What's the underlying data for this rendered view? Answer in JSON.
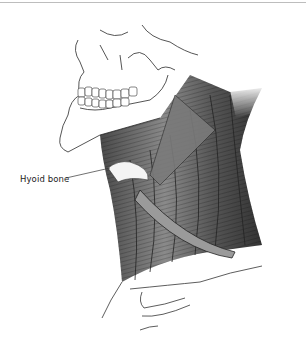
{
  "figure": {
    "labels": [
      {
        "text": "Hyoid bone",
        "target": "hyoid-bone"
      }
    ]
  },
  "colors": {
    "background": "#ffffff",
    "top_rule": "#bdbdbd",
    "muscle_dark": "#3a3a3a",
    "muscle_mid": "#6e6e6e",
    "muscle_light": "#a8a8a8",
    "outline": "#2a2a2a",
    "highlight": "#f2f2f2"
  }
}
